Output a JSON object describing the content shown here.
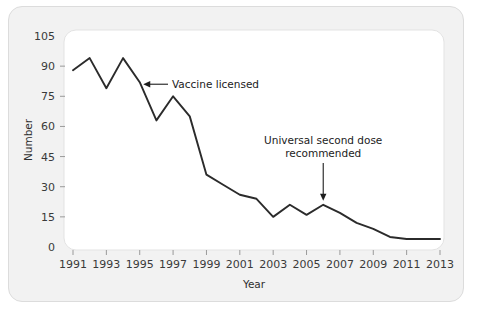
{
  "chart_data": {
    "type": "line",
    "title": "",
    "xlabel": "Year",
    "ylabel": "Number",
    "xlim": [
      1991,
      2013
    ],
    "ylim": [
      0,
      105
    ],
    "grid": false,
    "legend": "none",
    "x_tick_labels": [
      "1991",
      "1993",
      "1995",
      "1997",
      "1999",
      "2001",
      "2003",
      "2005",
      "2007",
      "2009",
      "2011",
      "2013"
    ],
    "x_tick_values": [
      1991,
      1993,
      1995,
      1997,
      1999,
      2001,
      2003,
      2005,
      2007,
      2009,
      2011,
      2013
    ],
    "y_tick_labels": [
      "0",
      "15",
      "30",
      "45",
      "60",
      "75",
      "90",
      "105"
    ],
    "y_tick_values": [
      0,
      15,
      30,
      45,
      60,
      75,
      90,
      105
    ],
    "x": [
      1991,
      1992,
      1993,
      1994,
      1995,
      1996,
      1997,
      1998,
      1999,
      2000,
      2001,
      2002,
      2003,
      2004,
      2005,
      2006,
      2007,
      2008,
      2009,
      2010,
      2011,
      2012,
      2013
    ],
    "values": [
      88,
      94,
      79,
      94,
      82,
      63,
      75,
      65,
      36,
      31,
      26,
      24,
      15,
      21,
      16,
      21,
      17,
      12,
      9,
      5,
      4,
      4,
      4
    ],
    "series": [
      {
        "name": "Number",
        "values": [
          88,
          94,
          79,
          94,
          82,
          63,
          75,
          65,
          36,
          31,
          26,
          24,
          15,
          21,
          16,
          21,
          17,
          12,
          9,
          5,
          4,
          4,
          4
        ],
        "color": "#2b2b2b"
      }
    ],
    "annotations": [
      {
        "id": "vaccine-licensed",
        "text": "Vaccine licensed",
        "target_x": 1995,
        "target_y": 82,
        "arrow": "left"
      },
      {
        "id": "universal-second-dose",
        "text_line1": "Universal second dose",
        "text_line2": "recommended",
        "target_x": 2006,
        "target_y": 21,
        "arrow": "down"
      }
    ],
    "colors": {
      "line": "#2b2b2b",
      "plot_background": "#ffffff",
      "card_background": "#f2f2f2",
      "tick_text": "#3a3a3a"
    }
  }
}
